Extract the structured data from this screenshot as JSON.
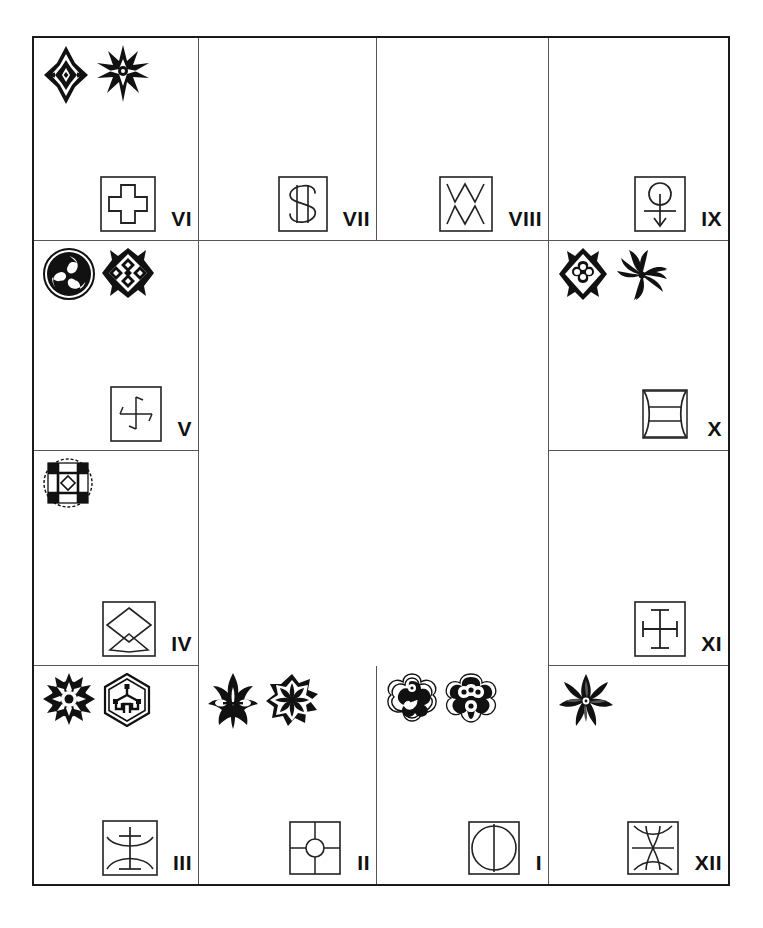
{
  "page": {
    "background_color": "#ffffff",
    "ink_color": "#1a1a1a",
    "rule_color": "#555555"
  },
  "grid": {
    "columns": 4,
    "rows": 4,
    "frame_border": "2px solid black"
  },
  "cells": [
    {
      "numeral": "VI",
      "row": 1,
      "col": 1,
      "crests": [
        "ornate-eight-point-star-crest",
        "ornate-radiant-burst-crest"
      ],
      "glyph": "greek-cross-in-box-glyph"
    },
    {
      "numeral": "VII",
      "row": 1,
      "col": 2,
      "crests": [],
      "glyph": "dollar-sign-in-box-glyph"
    },
    {
      "numeral": "VIII",
      "row": 1,
      "col": 3,
      "crests": [],
      "glyph": "double-zigzag-in-box-glyph"
    },
    {
      "numeral": "IX",
      "row": 1,
      "col": 4,
      "crests": [],
      "glyph": "circle-with-down-arrow-in-box-glyph"
    },
    {
      "numeral": "V",
      "row": 2,
      "col": 1,
      "crests": [
        "filled-triple-comma-roundel-crest",
        "lattice-diamond-crest"
      ],
      "glyph": "pinwheel-cross-in-box-glyph"
    },
    {
      "numeral": "X",
      "row": 2,
      "col": 4,
      "crests": [
        "quatrefoil-diamond-crest",
        "filled-swirl-rosette-crest"
      ],
      "glyph": "concave-square-with-bars-in-box-glyph"
    },
    {
      "numeral": "IV",
      "row": 3,
      "col": 1,
      "crests": [
        "checkered-roundel-crest"
      ],
      "glyph": "double-diamond-in-box-glyph"
    },
    {
      "numeral": "XI",
      "row": 3,
      "col": 4,
      "crests": [],
      "glyph": "barred-cross-in-box-glyph"
    },
    {
      "numeral": "III",
      "row": 4,
      "col": 1,
      "crests": [
        "spiked-sun-roundel-crest",
        "hexagon-knot-crest"
      ],
      "glyph": "double-arc-barred-staff-in-box-glyph"
    },
    {
      "numeral": "II",
      "row": 4,
      "col": 2,
      "crests": [
        "fleur-palmette-crest",
        "filled-eight-petal-rosette-crest"
      ],
      "glyph": "quartered-square-with-circle-glyph"
    },
    {
      "numeral": "I",
      "row": 4,
      "col": 3,
      "crests": [
        "comma-swirl-quatrefoil-crest",
        "four-loop-quatrefoil-crest"
      ],
      "glyph": "split-circle-in-box-glyph"
    },
    {
      "numeral": "XII",
      "row": 4,
      "col": 4,
      "crests": [
        "four-petal-flower-crest"
      ],
      "glyph": "hourglass-lens-in-box-glyph"
    }
  ],
  "empty_region": {
    "description": "large blank area spanning columns 2-3 of rows 2 and 3",
    "label": ""
  }
}
